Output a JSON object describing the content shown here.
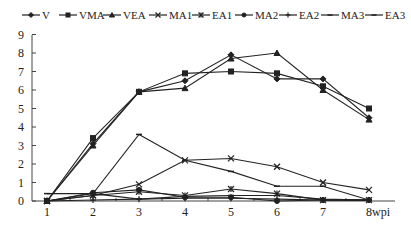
{
  "chart_data": {
    "type": "line",
    "title": "",
    "xlabel": "wpi",
    "ylabel": "",
    "x": [
      1,
      2,
      3,
      4,
      5,
      6,
      7,
      8
    ],
    "x_tick_labels": [
      "1",
      "2",
      "3",
      "4",
      "5",
      "6",
      "7",
      "8wpi"
    ],
    "y_tick_labels": [
      "0",
      "1",
      "2",
      "3",
      "4",
      "5",
      "6",
      "7",
      "8",
      "9"
    ],
    "ylim": [
      0,
      9
    ],
    "xlim": [
      1,
      8
    ],
    "grid": false,
    "legend_position": "top",
    "series": [
      {
        "name": "V",
        "marker": "diamond",
        "values": [
          0,
          3.1,
          5.9,
          6.5,
          7.9,
          6.6,
          6.6,
          4.5
        ]
      },
      {
        "name": "VMA",
        "marker": "square",
        "values": [
          0,
          3.4,
          5.9,
          6.9,
          7.0,
          6.9,
          6.2,
          5.0
        ]
      },
      {
        "name": "VEA",
        "marker": "triangle",
        "values": [
          0,
          3.0,
          5.9,
          6.1,
          7.7,
          8.0,
          6.0,
          4.4
        ]
      },
      {
        "name": "MA1",
        "marker": "x",
        "values": [
          0,
          0.3,
          0.9,
          2.2,
          2.3,
          1.85,
          1.0,
          0.6
        ]
      },
      {
        "name": "EA1",
        "marker": "asterisk",
        "values": [
          0,
          0.3,
          0.5,
          0.3,
          0.65,
          0.4,
          0.05,
          0.05
        ]
      },
      {
        "name": "MA2",
        "marker": "circle",
        "values": [
          0,
          0.45,
          0.6,
          0.2,
          0.2,
          0.0,
          0.05,
          0.05
        ]
      },
      {
        "name": "EA2",
        "marker": "plus",
        "values": [
          0,
          0.05,
          0.1,
          0.15,
          0.15,
          0.1,
          0.05,
          0.05
        ]
      },
      {
        "name": "MA3",
        "marker": "dash",
        "values": [
          0,
          0.4,
          3.6,
          2.2,
          1.6,
          0.8,
          0.8,
          0.05
        ]
      },
      {
        "name": "EA3",
        "marker": "dash",
        "values": [
          0.4,
          0.4,
          0.1,
          0.25,
          0.3,
          0.3,
          0.1,
          0.05
        ]
      }
    ]
  },
  "legend": {
    "items": [
      {
        "label": "V",
        "marker": "diamond"
      },
      {
        "label": "VMA",
        "marker": "square"
      },
      {
        "label": "VEA",
        "marker": "triangle"
      },
      {
        "label": "MA1",
        "marker": "x"
      },
      {
        "label": "EA1",
        "marker": "asterisk"
      },
      {
        "label": "MA2",
        "marker": "circle"
      },
      {
        "label": "EA2",
        "marker": "plus"
      },
      {
        "label": "MA3",
        "marker": "dash"
      },
      {
        "label": "EA3",
        "marker": "dash"
      }
    ]
  },
  "colors": {
    "line": "#222222",
    "axis": "#444444",
    "background": "#ffffff"
  }
}
